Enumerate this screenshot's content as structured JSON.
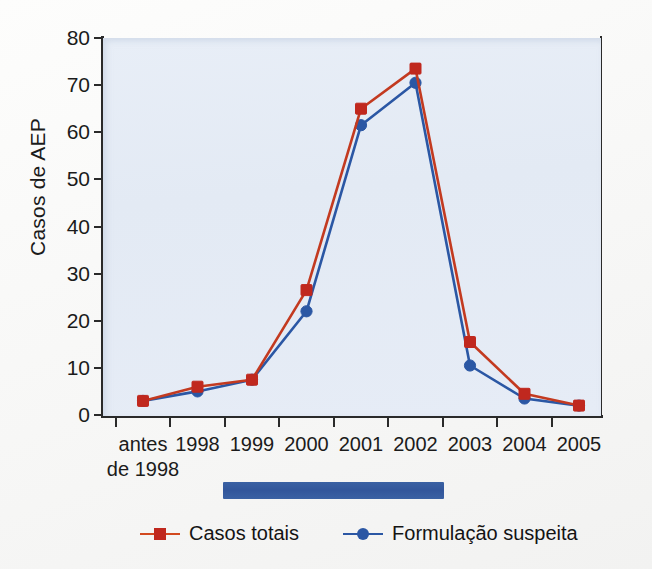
{
  "chart_data": {
    "type": "line",
    "title": "",
    "xlabel": "",
    "ylabel": "Casos de AEP",
    "ylim": [
      0,
      80
    ],
    "yticks": [
      0,
      10,
      20,
      30,
      40,
      50,
      60,
      70,
      80
    ],
    "grid": false,
    "legend_position": "bottom",
    "categories": [
      "antes\nde 1998",
      "1998",
      "1999",
      "2000",
      "2001",
      "2002",
      "2003",
      "2004",
      "2005"
    ],
    "series": [
      {
        "name": "Casos totais",
        "color": "#c0281e",
        "line_color": "#c33a20",
        "marker": "square",
        "values": [
          3,
          6,
          7.5,
          26.5,
          65,
          73.5,
          15.5,
          4.5,
          2
        ]
      },
      {
        "name": "Formulação suspeita",
        "color": "#2b57a4",
        "line_color": "#2b57a4",
        "marker": "circle",
        "values": [
          3,
          5,
          7.5,
          22,
          61.5,
          70.5,
          10.5,
          3.5,
          2
        ]
      }
    ],
    "annotations": [
      {
        "name": "period-bar",
        "label": "",
        "color": "#32569b",
        "start_category": "1998",
        "end_category": "2002"
      }
    ]
  },
  "axes": {
    "y_title": "Casos de AEP",
    "y_tick_labels": [
      "80",
      "70",
      "60",
      "50",
      "40",
      "30",
      "20",
      "10",
      "0"
    ],
    "x_tick_labels": [
      {
        "line1": "antes",
        "line2": "de 1998"
      },
      {
        "line1": "1998",
        "line2": ""
      },
      {
        "line1": "1999",
        "line2": ""
      },
      {
        "line1": "2000",
        "line2": ""
      },
      {
        "line1": "2001",
        "line2": ""
      },
      {
        "line1": "2002",
        "line2": ""
      },
      {
        "line1": "2003",
        "line2": ""
      },
      {
        "line1": "2004",
        "line2": ""
      },
      {
        "line1": "2005",
        "line2": ""
      }
    ]
  },
  "legend": {
    "entries": [
      {
        "label": "Casos totais",
        "color": "#c0281e",
        "line_color": "#d2491f",
        "marker": "square"
      },
      {
        "label": "Formulação suspeita",
        "color": "#2b57a4",
        "line_color": "#2b57a4",
        "marker": "circle"
      }
    ]
  },
  "colors": {
    "plot_background": "#e5ecf6",
    "page_background": "#fbfbfa",
    "axis": "#2a2a2a",
    "series_red": "#c0281e",
    "series_blue": "#2b57a4",
    "period_bar": "#32569b"
  }
}
